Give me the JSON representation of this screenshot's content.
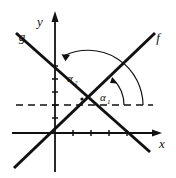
{
  "figure": {
    "type": "coordinate-geometry-diagram",
    "background_color": "#ffffff",
    "stroke_color": "#111111",
    "axes": {
      "x_label": "x",
      "y_label": "y",
      "origin": {
        "x": 55,
        "y": 133
      },
      "x_axis": {
        "from_x": 12,
        "to_x": 160,
        "y": 133,
        "arrow": "right"
      },
      "y_axis": {
        "x": 55,
        "from_y": 170,
        "to_y": 12,
        "arrow": "up"
      },
      "x_ticks": [
        73,
        91,
        109,
        127
      ],
      "y_ticks": [
        118,
        105,
        92,
        79,
        66
      ]
    },
    "lines": [
      {
        "name": "f",
        "label": "f",
        "label_x": 156,
        "label_y": 41,
        "slope_direction": "up-right",
        "x1": 14,
        "y1": 168,
        "x2": 155,
        "y2": 33
      },
      {
        "name": "g",
        "label": "g",
        "label_x": 21,
        "label_y": 40,
        "slope_direction": "down-right",
        "x1": 16,
        "y1": 33,
        "x2": 150,
        "y2": 152
      }
    ],
    "dashed_ray": {
      "name": "horizontal-reference",
      "y": 105,
      "from_x": 16,
      "to_x": 153,
      "style": "dashed"
    },
    "intersection_point": {
      "x": 88,
      "y": 105,
      "marked": true
    },
    "angles": [
      {
        "name": "alpha-1",
        "label": "α",
        "subscript": "1",
        "label_x": 105,
        "label_y": 99,
        "description": "angle from positive horizontal dashed ray to line f",
        "arc_radius": 36,
        "arrow_at": "line-f"
      },
      {
        "name": "alpha-2",
        "label": "α",
        "subscript": "2",
        "label_x": 72,
        "label_y": 80,
        "description": "angle from positive horizontal dashed ray to line g",
        "arc_radius": 55,
        "arrow_at": "line-g"
      }
    ]
  }
}
